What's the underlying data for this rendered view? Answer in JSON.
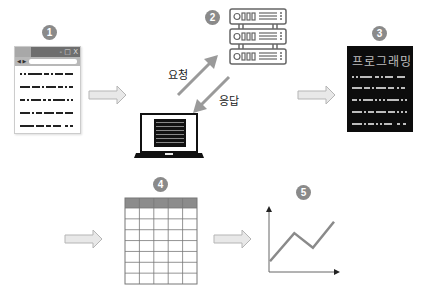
{
  "steps": [
    {
      "number": "1",
      "name": "browser-window"
    },
    {
      "number": "2",
      "name": "server"
    },
    {
      "number": "3",
      "name": "programming-document"
    },
    {
      "number": "4",
      "name": "data-table"
    },
    {
      "number": "5",
      "name": "line-graph"
    }
  ],
  "browser": {
    "window_controls": "- □ X",
    "nav_arrows": "◀ ▶"
  },
  "arrows": {
    "request_label": "요청",
    "response_label": "응답"
  },
  "document": {
    "title": "프로그래밍"
  },
  "table": {
    "columns": 5,
    "rows": 7
  },
  "graph": {
    "series": [
      0.2,
      0.72,
      0.45,
      0.93
    ]
  },
  "colors": {
    "badge": "#8a8a8a",
    "arrow_fill": "#e8e8e8",
    "arrow_stroke": "#b5b5b5",
    "diag_arrow": "#9a9a9a",
    "table_header": "#8c8c8c"
  }
}
